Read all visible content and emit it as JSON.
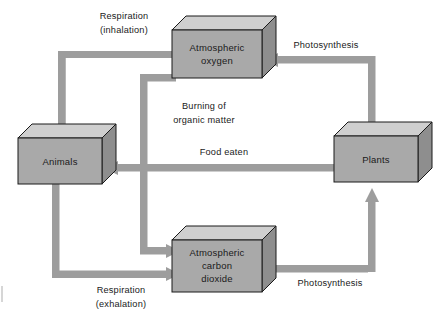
{
  "diagram": {
    "colors": {
      "background": "#ffffff",
      "box_front_fill": "#a9a9a9",
      "box_top_fill": "#cfcfcf",
      "box_side_fill": "#8e8e8e",
      "box_stroke": "#1a1a1a",
      "arrow_fill": "#9d9d9d",
      "text": "#1a1a1a",
      "page_edge": "#b5b5b5"
    },
    "nodes": [
      {
        "id": "atmospheric-oxygen",
        "label_lines": [
          "Atmospheric",
          "oxygen"
        ],
        "x": 172,
        "y": 30,
        "width": 90,
        "height": 48,
        "depth": 14
      },
      {
        "id": "animals",
        "label_lines": [
          "Animals"
        ],
        "x": 18,
        "y": 138,
        "width": 84,
        "height": 46,
        "depth": 14
      },
      {
        "id": "plants",
        "label_lines": [
          "Plants"
        ],
        "x": 334,
        "y": 136,
        "width": 84,
        "height": 46,
        "depth": 14
      },
      {
        "id": "atmospheric-carbon-dioxide",
        "label_lines": [
          "Atmospheric",
          "carbon",
          "dioxide"
        ],
        "x": 172,
        "y": 240,
        "width": 90,
        "height": 52,
        "depth": 14
      }
    ],
    "edges": [
      {
        "id": "respiration-inhalation",
        "label_lines": [
          "Respiration",
          "(inhalation)"
        ],
        "from": "atmospheric-oxygen",
        "to": "animals",
        "label_x": 124,
        "label_y": 19
      },
      {
        "id": "photosynthesis-oxygen",
        "label_lines": [
          "Photosynthesis",
          ""
        ],
        "label_single": "Photosynthesis",
        "from": "plants",
        "to": "atmospheric-oxygen",
        "label_x": 326,
        "label_y": 46
      },
      {
        "id": "burning-of-organic-matter",
        "label_lines": [
          "Burning of",
          "organic matter"
        ],
        "from": "atmospheric-oxygen",
        "to": "atmospheric-carbon-dioxide",
        "label_x": 200,
        "label_y": 113
      },
      {
        "id": "food-eaten",
        "label_single": "Food eaten",
        "from": "plants",
        "to": "animals",
        "label_x": 224,
        "label_y": 155
      },
      {
        "id": "respiration-exhalation",
        "label_lines": [
          "Respiration",
          "(exhalation)"
        ],
        "from": "animals",
        "to": "atmospheric-carbon-dioxide",
        "label_x": 121,
        "label_y": 291
      },
      {
        "id": "photosynthesis-carbon-dioxide",
        "label_single": "Photosynthesis",
        "from": "atmospheric-carbon-dioxide",
        "to": "plants",
        "label_x": 328,
        "label_y": 284
      }
    ]
  }
}
